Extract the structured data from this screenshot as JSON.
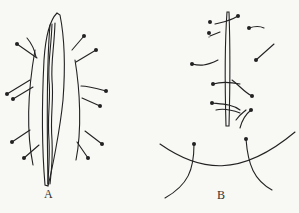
{
  "figure": {
    "panels": [
      {
        "label": "A",
        "description": "Elongated specimen pinned with insect pins on both sides"
      },
      {
        "label": "B",
        "description": "Narrow strip pinned with bent pins; curved line with two pins below"
      }
    ]
  }
}
